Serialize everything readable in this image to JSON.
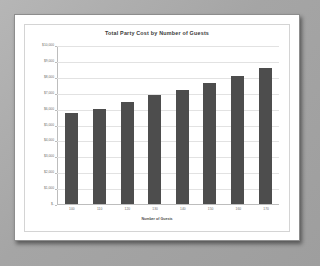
{
  "chart_data": {
    "type": "bar",
    "title": "Total Party Cost by Number of Guests",
    "xlabel": "Number of Guests",
    "ylabel": "",
    "categories": [
      "100",
      "110",
      "120",
      "130",
      "140",
      "150",
      "160",
      "170"
    ],
    "values": [
      5700,
      6000,
      6400,
      6850,
      7150,
      7600,
      8050,
      8550
    ],
    "ylim": [
      0,
      10000
    ],
    "ytick_labels": [
      "$10,000",
      "$9,000",
      "$8,000",
      "$7,000",
      "$6,000",
      "$5,000",
      "$4,000",
      "$3,000",
      "$2,000",
      "$1,000",
      "$-"
    ],
    "ytick_values": [
      10000,
      9000,
      8000,
      7000,
      6000,
      5000,
      4000,
      3000,
      2000,
      1000,
      0
    ],
    "grid": true,
    "legend": "none",
    "series_color": "#4d4d4d"
  },
  "colors": {
    "bar": "#4d4d4d",
    "grid": "#e2e2e2",
    "axis": "#bdbdbd",
    "paper": "#ffffff",
    "backdrop": "#a9a9a9"
  }
}
